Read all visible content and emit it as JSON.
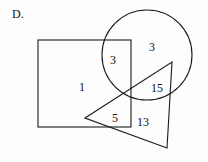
{
  "figure": {
    "item_letter": "D.",
    "width": 208,
    "height": 162,
    "stroke_color": "#1a1a1a",
    "background_color": "#fdfdfd",
    "text_color": "#111111"
  },
  "shapes": {
    "square": {
      "name": "square",
      "x": 38,
      "y": 40,
      "width": 93,
      "height": 87
    },
    "circle": {
      "name": "circle",
      "cx": 147,
      "cy": 55,
      "r": 45
    },
    "triangle": {
      "name": "triangle",
      "points": "85,118 172,62 167,148"
    }
  },
  "region_labels": [
    {
      "value": "3",
      "x": 113,
      "y": 60,
      "region": "square-circle-overlap"
    },
    {
      "value": "3",
      "x": 152,
      "y": 47,
      "region": "circle-only"
    },
    {
      "value": "1",
      "x": 82,
      "y": 87,
      "region": "square-only"
    },
    {
      "value": "15",
      "x": 157,
      "y": 88,
      "region": "circle-triangle-overlap"
    },
    {
      "value": "5",
      "x": 115,
      "y": 118,
      "region": "square-triangle-overlap"
    },
    {
      "value": "13",
      "x": 143,
      "y": 122,
      "region": "triangle-only"
    }
  ]
}
